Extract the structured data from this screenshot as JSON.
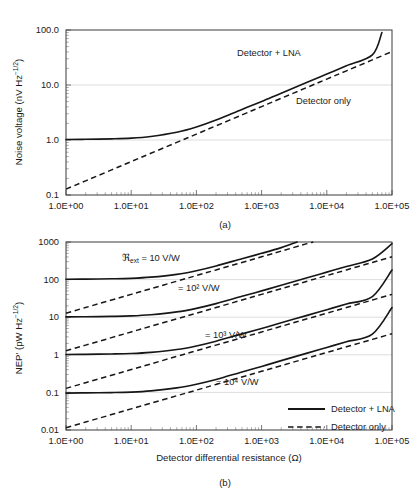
{
  "figure": {
    "panels": [
      {
        "caption": "(a)"
      },
      {
        "caption": "(b)"
      }
    ]
  },
  "legend": {
    "solid_label": "Detector + LNA",
    "dashed_label": "Detector only"
  },
  "colors": {
    "curve": "#161616",
    "frame": "#3b3b3b",
    "grid": "#d9d9d9",
    "background": "#ffffff"
  },
  "chart_data": [
    {
      "type": "line",
      "panel": "(a)",
      "title": "",
      "xlabel": "",
      "ylabel": "Noise voltage (nV Hz−1/2)",
      "ylabel_parts": {
        "main": "Noise voltage (nV Hz",
        "exponent": "−1/2",
        "tail": ")"
      },
      "xscale": "log",
      "yscale": "log",
      "xlim": [
        1,
        100000
      ],
      "ylim": [
        0.1,
        100
      ],
      "grid": true,
      "xticks": [
        1,
        10,
        100,
        1000,
        10000,
        100000
      ],
      "xticklabels": [
        "1.0E+00",
        "1.0E+01",
        "1.0E+02",
        "1.0E+03",
        "1.0E+04",
        "1.0E+05"
      ],
      "yticks": [
        0.1,
        1,
        10,
        100
      ],
      "yticklabels": [
        "0.1",
        "1.0",
        "10.0",
        "100.0"
      ],
      "legend_position": "inline-annotations",
      "annotations": [
        {
          "text": "Detector + LNA",
          "x": 1500,
          "y": 28
        },
        {
          "text": "Detector only",
          "x": 12000,
          "y": 7.5
        }
      ],
      "series": [
        {
          "name": "Detector + LNA",
          "style": "solid",
          "x": [
            1,
            2,
            5,
            10,
            20,
            50,
            100,
            200,
            500,
            1000,
            2000,
            5000,
            10000,
            20000,
            50000,
            70000
          ],
          "y": [
            1.02,
            1.03,
            1.05,
            1.08,
            1.16,
            1.38,
            1.72,
            2.3,
            3.6,
            5.0,
            7.1,
            11.2,
            15.8,
            22.4,
            35.4,
            90.0
          ]
        },
        {
          "name": "Detector only",
          "style": "dashed",
          "x": [
            1,
            2,
            5,
            10,
            20,
            50,
            100,
            200,
            500,
            1000,
            2000,
            5000,
            10000,
            20000,
            50000,
            100000
          ],
          "y": [
            0.128,
            0.181,
            0.286,
            0.405,
            0.573,
            0.906,
            1.28,
            1.81,
            2.86,
            4.05,
            5.73,
            9.06,
            12.8,
            18.1,
            28.6,
            40.5
          ]
        }
      ]
    },
    {
      "type": "line",
      "panel": "(b)",
      "title": "",
      "xlabel": "Detector differential resistance (Ω)",
      "ylabel": "NEP' (pW Hz−1/2)",
      "ylabel_parts": {
        "main": "NEP' (pW Hz",
        "exponent": "−1/2",
        "tail": ")"
      },
      "xscale": "log",
      "yscale": "log",
      "xlim": [
        1,
        100000
      ],
      "ylim": [
        0.01,
        1000
      ],
      "grid": true,
      "xticks": [
        1,
        10,
        100,
        1000,
        10000,
        100000
      ],
      "xticklabels": [
        "1.0E+00",
        "1.0E+01",
        "1.0E+02",
        "1.0E+03",
        "1.0E+04",
        "1.0E+05"
      ],
      "yticks": [
        0.01,
        0.1,
        1,
        10,
        100,
        1000
      ],
      "yticklabels": [
        "0.01",
        "0.1",
        "1",
        "10",
        "100",
        "1000"
      ],
      "legend_position": "lower-right",
      "annotations": [
        {
          "text_prefix": "ℜ",
          "text_sub": "ext",
          "text_rest": " = 10 V/W",
          "x": 14,
          "y": 330
        },
        {
          "text_prefix": "",
          "text_sub": "",
          "text_rest": "= 10² V/W",
          "x": 160,
          "y": 42
        },
        {
          "text_prefix": "",
          "text_sub": "",
          "text_rest": "= 10³ V/W",
          "x": 260,
          "y": 4.2
        },
        {
          "text_prefix": "",
          "text_sub": "",
          "text_rest": "= 10⁴ V/W",
          "x": 330,
          "y": 0.42
        }
      ],
      "responsivity_labels": [
        "ℜext = 10 V/W",
        "= 10² V/W",
        "= 10³ V/W",
        "= 10⁴ V/W"
      ],
      "series": [
        {
          "name": "Detector + LNA, R_ext = 10 V/W",
          "style": "solid",
          "responsivity": "10 V/W",
          "x": [
            1,
            2,
            5,
            10,
            20,
            50,
            100,
            200,
            500,
            1000,
            2000,
            3500
          ],
          "y": [
            102,
            103,
            105,
            108,
            116,
            138,
            172,
            230,
            360,
            500,
            710,
            1000
          ]
        },
        {
          "name": "Detector only, R_ext = 10 V/W",
          "style": "dashed",
          "responsivity": "10 V/W",
          "x": [
            1,
            2,
            5,
            10,
            20,
            50,
            100,
            200,
            500,
            1000,
            2000,
            5000,
            6200
          ],
          "y": [
            12.8,
            18.1,
            28.6,
            40.5,
            57.3,
            90.6,
            128,
            181,
            286,
            405,
            573,
            906,
            1000
          ]
        },
        {
          "name": "Detector + LNA, R_ext = 10^2 V/W",
          "style": "solid",
          "responsivity": "10² V/W",
          "x": [
            1,
            2,
            5,
            10,
            20,
            50,
            100,
            200,
            500,
            1000,
            2000,
            5000,
            10000,
            20000,
            50000,
            100000
          ],
          "y": [
            10.2,
            10.3,
            10.5,
            10.8,
            11.6,
            13.8,
            17.2,
            23.0,
            36.0,
            50.0,
            71.0,
            112,
            158,
            224,
            354,
            900
          ]
        },
        {
          "name": "Detector only, R_ext = 10^2 V/W",
          "style": "dashed",
          "responsivity": "10² V/W",
          "x": [
            1,
            2,
            5,
            10,
            20,
            50,
            100,
            200,
            500,
            1000,
            2000,
            5000,
            10000,
            20000,
            50000,
            100000
          ],
          "y": [
            1.28,
            1.81,
            2.86,
            4.05,
            5.73,
            9.06,
            12.8,
            18.1,
            28.6,
            40.5,
            57.3,
            90.6,
            128,
            181,
            286,
            405
          ]
        },
        {
          "name": "Detector + LNA, R_ext = 10^3 V/W",
          "style": "solid",
          "responsivity": "10³ V/W",
          "x": [
            1,
            2,
            5,
            10,
            20,
            50,
            100,
            200,
            500,
            1000,
            2000,
            5000,
            10000,
            20000,
            50000,
            100000
          ],
          "y": [
            1.02,
            1.03,
            1.05,
            1.08,
            1.16,
            1.38,
            1.72,
            2.3,
            3.6,
            5.0,
            7.1,
            11.2,
            15.8,
            22.4,
            35.4,
            180
          ]
        },
        {
          "name": "Detector only, R_ext = 10^3 V/W",
          "style": "dashed",
          "responsivity": "10³ V/W",
          "x": [
            1,
            2,
            5,
            10,
            20,
            50,
            100,
            200,
            500,
            1000,
            2000,
            5000,
            10000,
            20000,
            50000,
            100000
          ],
          "y": [
            0.128,
            0.181,
            0.286,
            0.405,
            0.573,
            0.906,
            1.28,
            1.81,
            2.86,
            4.05,
            5.73,
            9.06,
            12.8,
            18.1,
            28.6,
            40.5
          ]
        },
        {
          "name": "Detector + LNA, R_ext = 10^4 V/W",
          "style": "solid",
          "responsivity": "10⁴ V/W",
          "x": [
            1,
            2,
            5,
            10,
            20,
            50,
            100,
            200,
            500,
            1000,
            2000,
            5000,
            10000,
            20000,
            50000,
            100000
          ],
          "y": [
            0.096,
            0.097,
            0.099,
            0.102,
            0.11,
            0.132,
            0.165,
            0.22,
            0.35,
            0.49,
            0.7,
            1.11,
            1.57,
            2.23,
            3.53,
            18.0
          ]
        },
        {
          "name": "Detector only, R_ext = 10^4 V/W",
          "style": "dashed",
          "responsivity": "10⁴ V/W",
          "x": [
            1,
            2,
            5,
            10,
            20,
            50,
            100,
            200,
            500,
            1000,
            2000,
            5000,
            10000,
            20000,
            50000,
            100000
          ],
          "y": [
            0.0115,
            0.0163,
            0.0257,
            0.0364,
            0.0515,
            0.0815,
            0.115,
            0.163,
            0.257,
            0.364,
            0.515,
            0.815,
            1.15,
            1.63,
            2.57,
            3.64
          ]
        }
      ]
    }
  ]
}
